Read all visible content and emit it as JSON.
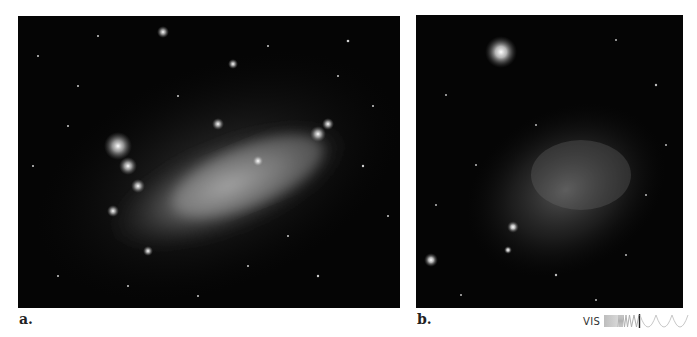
{
  "figure": {
    "panels": [
      {
        "id": "a",
        "label": "a.",
        "description": "Irregular galaxy with elongated bright bar and clusters of star-forming regions, grayscale visible-light image"
      },
      {
        "id": "b",
        "label": "b.",
        "description": "Diffuse irregular galaxy, faint glow with a bright foreground star at upper left, grayscale visible-light image"
      }
    ],
    "wavelength_indicator": {
      "label": "VIS",
      "icon": "spectrum-wave-icon",
      "highlight_band": "visible"
    },
    "colors": {
      "background": "#ffffff",
      "image_background": "#050505",
      "label_text": "#222222"
    }
  }
}
